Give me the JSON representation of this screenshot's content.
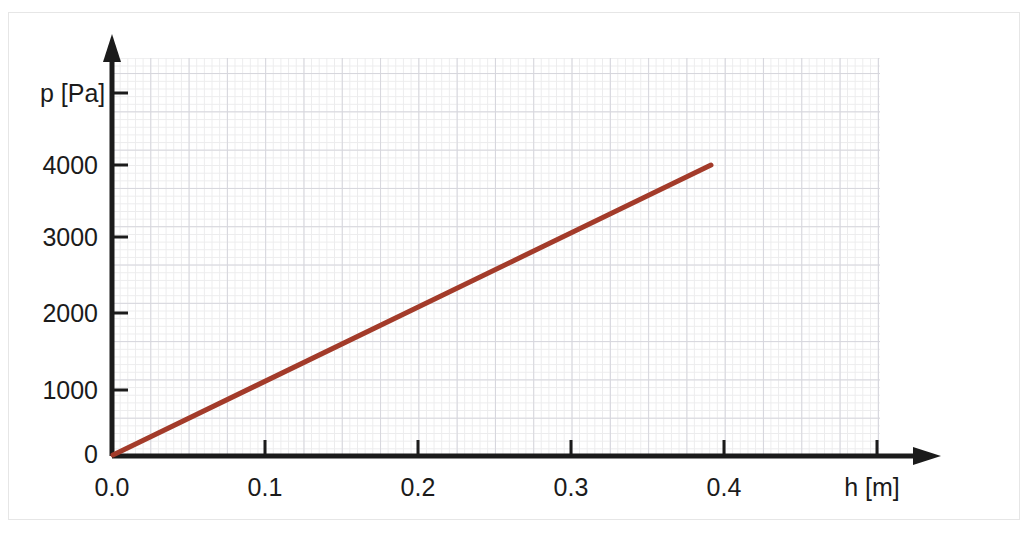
{
  "figure": {
    "background_color": "#ffffff",
    "frame_color": "#b8b8b8",
    "grid_major_color": "#d6d6dd",
    "grid_minor_color": "#ececed",
    "axis_color": "#1b1b1b",
    "line_color": "#a33b2a"
  },
  "axes": {
    "y_axis_label": "p [Pa]",
    "x_axis_label": "h [m]",
    "y_ticks": [
      {
        "value": 0,
        "label": "0"
      },
      {
        "value": 1000,
        "label": "1000"
      },
      {
        "value": 2000,
        "label": "2000"
      },
      {
        "value": 3000,
        "label": "3000"
      },
      {
        "value": 4000,
        "label": "4000"
      }
    ],
    "x_ticks": [
      {
        "value": 0.0,
        "label": "0.0"
      },
      {
        "value": 0.1,
        "label": "0.1"
      },
      {
        "value": 0.2,
        "label": "0.2"
      },
      {
        "value": 0.3,
        "label": "0.3"
      },
      {
        "value": 0.4,
        "label": "0.4"
      }
    ]
  },
  "chart_data": {
    "type": "line",
    "title": "",
    "xlabel": "h [m]",
    "ylabel": "p [Pa]",
    "xlim": [
      0.0,
      0.46
    ],
    "ylim": [
      0,
      4650
    ],
    "grid": true,
    "legend": null,
    "xticks": [
      0.0,
      0.1,
      0.2,
      0.3,
      0.4
    ],
    "xticklabels": [
      "0.0",
      "0.1",
      "0.2",
      "0.3",
      "0.4"
    ],
    "yticks": [
      0,
      1000,
      2000,
      3000,
      4000
    ],
    "yticklabels": [
      "0",
      "1000",
      "2000",
      "3000",
      "4000"
    ],
    "series": [
      {
        "name": "p(h)",
        "color": "#a33b2a",
        "linewidth": 5,
        "x": [
          0.0,
          0.05,
          0.1,
          0.15,
          0.2,
          0.25,
          0.3,
          0.35,
          0.4
        ],
        "y": [
          0,
          500,
          1000,
          1500,
          2000,
          2500,
          3000,
          3500,
          4000
        ]
      }
    ],
    "annotations": []
  }
}
